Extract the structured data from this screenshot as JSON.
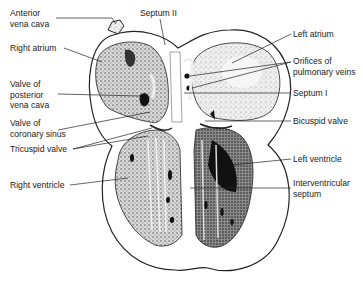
{
  "figure": {
    "labels": {
      "anterior_vena_cava": "Anterior\nvena cava",
      "septum_ii": "Septum II",
      "right_atrium": "Right atrium",
      "valve_posterior_vena_cava": "Valve of\nposterior\nvena cava",
      "valve_coronary_sinus": "Valve of\ncoronary sinus",
      "tricuspid_valve": "Tricuspid valve",
      "right_ventricle": "Right ventricle",
      "left_atrium": "Left atrium",
      "orifices_pulmonary_veins": "Orifices of\npulmonary veins",
      "septum_i": "Septum I",
      "bicuspid_valve": "Bicuspid valve",
      "left_ventricle": "Left ventricle",
      "interventricular_septum": "Interventricular\nseptum"
    }
  }
}
